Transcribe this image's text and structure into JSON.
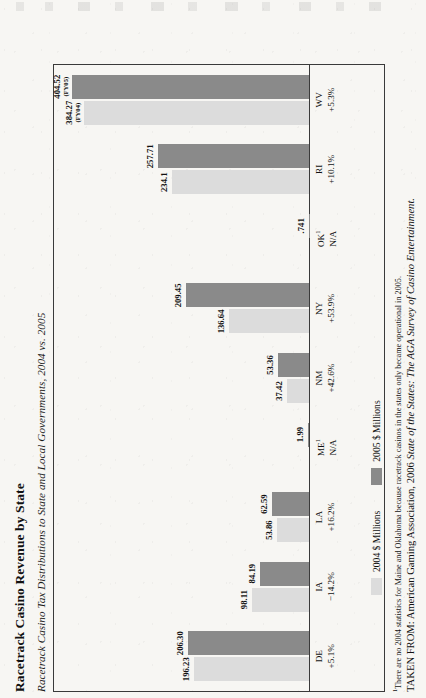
{
  "figure": {
    "title": "Racetrack Casino Revenue by State",
    "subtitle": "Racetrack Casino Tax Distributions to State and Local Governments, 2004 vs. 2005",
    "footnote_marker": "1",
    "footnote": "There are no 2004 statistics for Maine and Oklahoma because racetrack casinos in the states only became operational in 2005.",
    "source_prefix": "TAKEN FROM: American Gaming Association, 2006 ",
    "source_italic": "State of the States: The AGA Survey of Casino Entertainment."
  },
  "legend": {
    "items": [
      {
        "label": "2004 $ Millions",
        "color": "#dcdcdc"
      },
      {
        "label": "2005 $ Millions",
        "color": "#8a8a8a"
      }
    ]
  },
  "chart_data": {
    "type": "bar",
    "title": "Racetrack Casino Revenue by State",
    "subtitle": "Racetrack Casino Tax Distributions to State and Local Governments, 2004 vs. 2005",
    "orientation": "vertical",
    "xlabel": "",
    "ylabel": "$ Millions",
    "ylim": [
      0,
      420
    ],
    "grid": false,
    "legend_position": "bottom-left",
    "categories": [
      "DE",
      "IA",
      "LA",
      "ME",
      "NM",
      "NY",
      "OK",
      "RI",
      "WV"
    ],
    "category_change": [
      "+5.1%",
      "−14.2%",
      "+16.2%",
      "N/A",
      "+42.6%",
      "+53.9%",
      "N/A",
      "+10.1%",
      "+5.3%"
    ],
    "category_footnote": [
      false,
      false,
      false,
      true,
      false,
      false,
      true,
      false,
      false
    ],
    "series": [
      {
        "name": "2004 $ Millions",
        "color": "#dcdcdc",
        "values": [
          196.23,
          98.11,
          53.86,
          null,
          37.42,
          136.64,
          null,
          234.1,
          384.27
        ],
        "labels": [
          "196.23",
          "98.11",
          "53.86",
          "",
          "37.42",
          "136.64",
          "",
          "234.1",
          "384.27"
        ],
        "label_notes": [
          "",
          "",
          "",
          "",
          "",
          "",
          "",
          "",
          "(FY04)"
        ]
      },
      {
        "name": "2005 $ Millions",
        "color": "#8a8a8a",
        "values": [
          206.3,
          84.19,
          62.59,
          1.99,
          53.36,
          209.45,
          0.741,
          257.71,
          404.52
        ],
        "labels": [
          "206.30",
          "84.19",
          "62.59",
          "1.99",
          "53.36",
          "209.45",
          ".741",
          "257.71",
          "404.52"
        ],
        "label_notes": [
          "",
          "",
          "",
          "",
          "",
          "",
          "",
          "",
          "(FY05)"
        ]
      }
    ]
  }
}
